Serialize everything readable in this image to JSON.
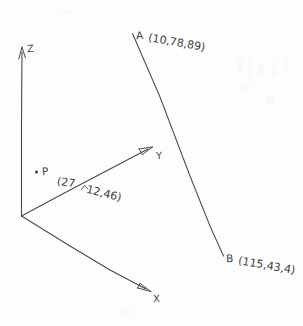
{
  "figure": {
    "kind": "hand-drawn-3d-axes-sketch",
    "background_color": "#fdfdfd",
    "ink_color": "#3a3a3a"
  },
  "axes": {
    "z": {
      "label": "Z",
      "direction": "up"
    },
    "y": {
      "label": "Y",
      "direction": "up-right"
    },
    "x": {
      "label": "X",
      "direction": "down-right"
    },
    "origin_label": ""
  },
  "points": {
    "p": {
      "name": "P",
      "coord_part1": "(27",
      "coord_part2": "12,46)",
      "coord_full": "(27,12,46)"
    },
    "a": {
      "name": "A",
      "coords": "(10,78,89)"
    },
    "b": {
      "name": "B",
      "coords": "(115,43,4)"
    }
  },
  "line_segment": {
    "from": "A",
    "to": "B"
  }
}
